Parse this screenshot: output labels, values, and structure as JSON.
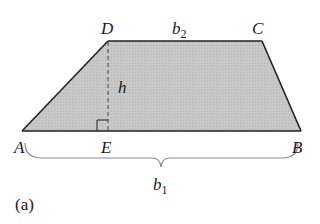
{
  "figure": {
    "caption": "(a)",
    "shape": "trapezoid",
    "fill_color": "#c4c4c4",
    "edge_color": "#222222",
    "brace_color": "#8a8a8a",
    "vertices": {
      "A": "A",
      "B": "B",
      "C": "C",
      "D": "D",
      "E": "E"
    },
    "labels": {
      "top_base": "b",
      "top_base_sub": "2",
      "bottom_base": "b",
      "bottom_base_sub": "1",
      "height": "h"
    }
  }
}
